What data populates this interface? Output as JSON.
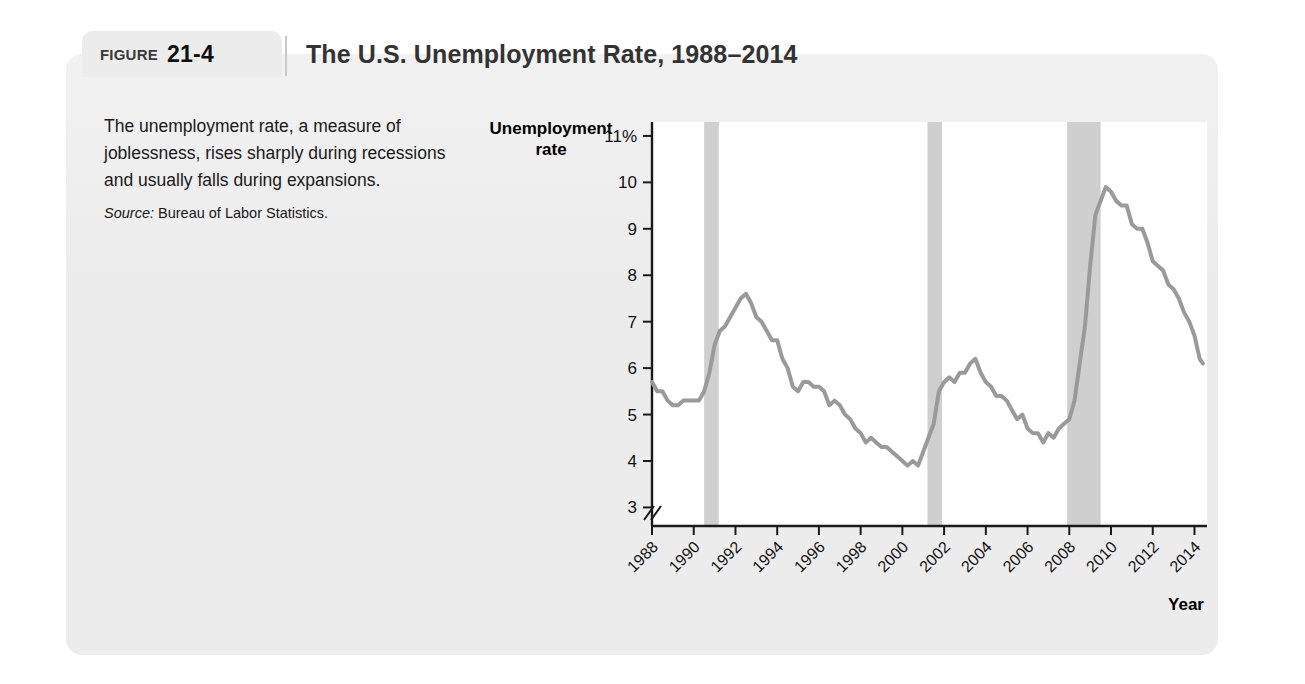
{
  "figure": {
    "label_word": "FIGURE",
    "number": "21-4",
    "title": "The U.S. Unemployment Rate, 1988–2014"
  },
  "caption": {
    "text": "The unemployment rate, a measure of joblessness, rises sharply during recessions and usually falls during expansions.",
    "source_label": "Source:",
    "source_value": " Bureau of Labor Statistics."
  },
  "colors": {
    "panel_background": "#ececec",
    "plot_background": "#ffffff",
    "line": "#9a9a9a",
    "recession_band": "#cfcfcf",
    "axis": "#1a1a1a",
    "title_text": "#333333"
  },
  "chart_data": {
    "type": "line",
    "title": "The U.S. Unemployment Rate, 1988–2014",
    "xlabel": "Year",
    "ylabel": "Unemployment rate",
    "xlim": [
      1988,
      2014.6
    ],
    "ylim": [
      2.6,
      11.3
    ],
    "grid": false,
    "legend": null,
    "y_ticks": [
      11,
      10,
      9,
      8,
      7,
      6,
      5,
      4,
      3
    ],
    "y_tick_labels": [
      "11%",
      "10",
      "9",
      "8",
      "7",
      "6",
      "5",
      "4",
      "3"
    ],
    "x_ticks": [
      1988,
      1990,
      1992,
      1994,
      1996,
      1998,
      2000,
      2002,
      2004,
      2006,
      2008,
      2010,
      2012,
      2014
    ],
    "x_tick_labels": [
      "1988",
      "1990",
      "1992",
      "1994",
      "1996",
      "1998",
      "2000",
      "2002",
      "2004",
      "2006",
      "2008",
      "2010",
      "2012",
      "2014"
    ],
    "axis_break": true,
    "units": "percent",
    "recession_bands": [
      {
        "start": 1990.5,
        "end": 1991.2,
        "label": "1990–1991 recession"
      },
      {
        "start": 2001.2,
        "end": 2001.9,
        "label": "2001 recession"
      },
      {
        "start": 2007.9,
        "end": 2009.5,
        "label": "2007–2009 recession"
      }
    ],
    "series": [
      {
        "name": "U.S. unemployment rate",
        "x": [
          1988.0,
          1988.25,
          1988.5,
          1988.75,
          1989.0,
          1989.25,
          1989.5,
          1989.75,
          1990.0,
          1990.25,
          1990.5,
          1990.75,
          1991.0,
          1991.25,
          1991.5,
          1991.75,
          1992.0,
          1992.25,
          1992.5,
          1992.75,
          1993.0,
          1993.25,
          1993.5,
          1993.75,
          1994.0,
          1994.25,
          1994.5,
          1994.75,
          1995.0,
          1995.25,
          1995.5,
          1995.75,
          1996.0,
          1996.25,
          1996.5,
          1996.75,
          1997.0,
          1997.25,
          1997.5,
          1997.75,
          1998.0,
          1998.25,
          1998.5,
          1998.75,
          1999.0,
          1999.25,
          1999.5,
          1999.75,
          2000.0,
          2000.25,
          2000.5,
          2000.75,
          2001.0,
          2001.25,
          2001.5,
          2001.75,
          2002.0,
          2002.25,
          2002.5,
          2002.75,
          2003.0,
          2003.25,
          2003.5,
          2003.75,
          2004.0,
          2004.25,
          2004.5,
          2004.75,
          2005.0,
          2005.25,
          2005.5,
          2005.75,
          2006.0,
          2006.25,
          2006.5,
          2006.75,
          2007.0,
          2007.25,
          2007.5,
          2007.75,
          2008.0,
          2008.25,
          2008.5,
          2008.75,
          2009.0,
          2009.25,
          2009.5,
          2009.75,
          2010.0,
          2010.25,
          2010.5,
          2010.75,
          2011.0,
          2011.25,
          2011.5,
          2011.75,
          2012.0,
          2012.25,
          2012.5,
          2012.75,
          2013.0,
          2013.25,
          2013.5,
          2013.75,
          2014.0,
          2014.25,
          2014.4
        ],
        "y": [
          5.7,
          5.5,
          5.5,
          5.3,
          5.2,
          5.2,
          5.3,
          5.3,
          5.3,
          5.3,
          5.5,
          5.9,
          6.5,
          6.8,
          6.9,
          7.1,
          7.3,
          7.5,
          7.6,
          7.4,
          7.1,
          7.0,
          6.8,
          6.6,
          6.6,
          6.2,
          6.0,
          5.6,
          5.5,
          5.7,
          5.7,
          5.6,
          5.6,
          5.5,
          5.2,
          5.3,
          5.2,
          5.0,
          4.9,
          4.7,
          4.6,
          4.4,
          4.5,
          4.4,
          4.3,
          4.3,
          4.2,
          4.1,
          4.0,
          3.9,
          4.0,
          3.9,
          4.2,
          4.5,
          4.8,
          5.5,
          5.7,
          5.8,
          5.7,
          5.9,
          5.9,
          6.1,
          6.2,
          5.9,
          5.7,
          5.6,
          5.4,
          5.4,
          5.3,
          5.1,
          4.9,
          5.0,
          4.7,
          4.6,
          4.6,
          4.4,
          4.6,
          4.5,
          4.7,
          4.8,
          4.9,
          5.3,
          6.1,
          6.9,
          8.2,
          9.3,
          9.6,
          9.9,
          9.8,
          9.6,
          9.5,
          9.5,
          9.1,
          9.0,
          9.0,
          8.7,
          8.3,
          8.2,
          8.1,
          7.8,
          7.7,
          7.5,
          7.2,
          7.0,
          6.7,
          6.2,
          6.1
        ]
      }
    ]
  }
}
